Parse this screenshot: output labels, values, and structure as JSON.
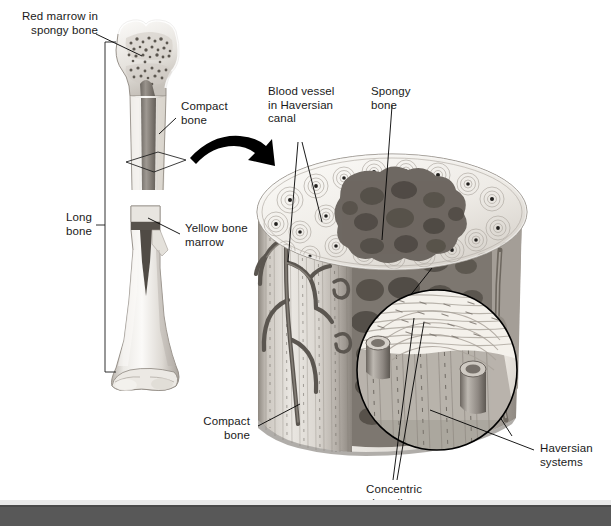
{
  "figure": {
    "background_color": "#ffffff",
    "width": 611,
    "height": 526
  },
  "labels": {
    "red_marrow": "Red marrow in\nspongy bone",
    "compact_bone_top": "Compact\nbone",
    "long_bone": "Long\nbone",
    "yellow_marrow": "Yellow bone\nmarrow",
    "blood_vessel": "Blood vessel\nin Haversian\ncanal",
    "spongy_bone": "Spongy\nbone",
    "compact_bone_bottom": "Compact\nbone",
    "concentric_lamellae": "Concentric\nlamellae",
    "haversian_systems": "Haversian\nsystems"
  },
  "colors": {
    "text": "#1a1a1a",
    "leader_line": "#000000",
    "arrow": "#000000",
    "footer_band": "#585858",
    "footer_strip": "#e9e9e9",
    "bone_light": "#f2f0ec",
    "bone_mid": "#cfcac3",
    "bone_shadow": "#9b958d",
    "marrow_dark": "#7b756e",
    "spongy_dark": "#6e6862",
    "vessel_dark": "#5f5a55"
  },
  "icons": {
    "transition_arrow": "curved-arrow-icon",
    "cut_plane": "cut-plane-marker-icon",
    "magnifier_circle": "magnified-inset-circle-icon",
    "bracket": "range-bracket-icon"
  }
}
